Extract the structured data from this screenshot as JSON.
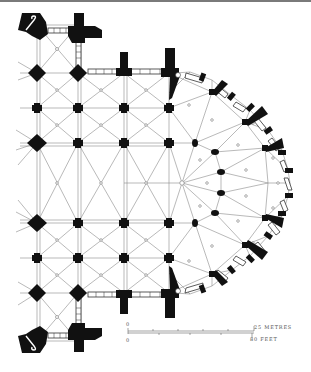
{
  "figure": {
    "background": "#ffffff",
    "ink_color": "#111111",
    "line_color": "#777777"
  },
  "scale_bar": {
    "zero_metres": "0",
    "zero_feet": "0",
    "metres_label": "25 METRES",
    "feet_label": "80 FEET"
  },
  "plan": {
    "grid_columns_x": [
      37,
      78,
      124,
      169
    ],
    "grid_rows_y": [
      25,
      73,
      108,
      143,
      183,
      223,
      258,
      293,
      341
    ],
    "apse_center": [
      182,
      183
    ],
    "elements": [
      "north-west tower with spiral stair",
      "south-west tower with spiral stair",
      "nave and aisle piers",
      "quadripartite rib vaults",
      "hemicycle piers",
      "ambulatory vaults",
      "radiating chapels",
      "flying buttress piers"
    ]
  }
}
